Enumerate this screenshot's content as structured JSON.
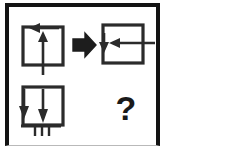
{
  "puzzle": {
    "type": "visual-analogy-matrix",
    "stroke_color": "#2b2b2b",
    "frame_color": "#131313",
    "background_color": "#ffffff",
    "cells": [
      {
        "id": "top-left",
        "position": "top-left",
        "description": "square box with upward arrow inside and leftward arrow across the top",
        "elements": [
          "square",
          "up-arrow",
          "left-arrow"
        ]
      },
      {
        "id": "top-right",
        "position": "top-right",
        "description": "square box with leftward arrow entering from the right and downward arrow at the left side",
        "elements": [
          "square",
          "left-arrow",
          "down-arrow"
        ]
      },
      {
        "id": "bottom-left",
        "position": "bottom-left",
        "description": "square box with two downward arrows and a ground hatch symbol below",
        "elements": [
          "square",
          "down-arrow",
          "down-arrow",
          "ground-hatch"
        ]
      },
      {
        "id": "bottom-right",
        "position": "bottom-right",
        "description": "unknown answer cell",
        "elements": [
          "question-mark"
        ],
        "label": "?"
      }
    ],
    "transform_arrow": {
      "direction": "right",
      "style": "outlined",
      "label": "⇒"
    }
  }
}
